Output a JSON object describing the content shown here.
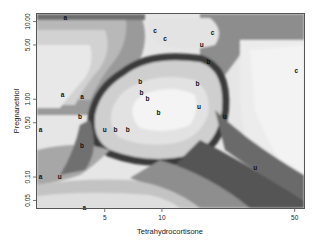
{
  "chart_data": {
    "type": "heatmap",
    "title": "",
    "xlabel": "Tetrahydrocortisone",
    "ylabel": "Pregnanetriol",
    "xscale": "log",
    "yscale": "log",
    "xlim": [
      2.2,
      56
    ],
    "ylim": [
      0.04,
      12.5
    ],
    "xticks": [
      {
        "value": 5,
        "label": "5"
      },
      {
        "value": 10,
        "label": "10"
      },
      {
        "value": 50,
        "label": "50"
      }
    ],
    "yticks": [
      {
        "value": 0.05,
        "label": "0.05"
      },
      {
        "value": 0.1,
        "label": "0.10"
      },
      {
        "value": 0.5,
        "label": "0.50"
      },
      {
        "value": 1.0,
        "label": "1.00"
      },
      {
        "value": 5.0,
        "label": "5.00"
      },
      {
        "value": 10.0,
        "label": "10.00"
      }
    ],
    "grid": false,
    "legend": "none",
    "colormap": "greyscale (dark = class boundary, light = class interior)",
    "points": [
      {
        "label": "a",
        "x": 3.1,
        "y": 11.1
      },
      {
        "label": "a",
        "x": 3.0,
        "y": 1.15
      },
      {
        "label": "a",
        "x": 3.8,
        "y": 1.07
      },
      {
        "label": "a",
        "x": 2.3,
        "y": 0.4
      },
      {
        "label": "a",
        "x": 2.3,
        "y": 0.1
      },
      {
        "label": "a",
        "x": 3.9,
        "y": 0.04
      },
      {
        "label": "b",
        "x": 3.7,
        "y": 0.6
      },
      {
        "label": "b",
        "x": 3.8,
        "y": 0.25
      },
      {
        "label": "b",
        "x": 7.7,
        "y": 1.7
      },
      {
        "label": "b",
        "x": 7.8,
        "y": 1.2
      },
      {
        "label": "b",
        "x": 8.4,
        "y": 1.0
      },
      {
        "label": "b",
        "x": 9.6,
        "y": 0.68
      },
      {
        "label": "b",
        "x": 15.4,
        "y": 1.6
      },
      {
        "label": "b",
        "x": 5.7,
        "y": 0.4
      },
      {
        "label": "b",
        "x": 6.6,
        "y": 0.4
      },
      {
        "label": "b",
        "x": 17.6,
        "y": 3.0
      },
      {
        "label": "c",
        "x": 9.2,
        "y": 7.5
      },
      {
        "label": "c",
        "x": 10.4,
        "y": 6.0
      },
      {
        "label": "c",
        "x": 18.5,
        "y": 7.2
      },
      {
        "label": "c",
        "x": 51.0,
        "y": 2.3
      },
      {
        "label": "u",
        "x": 16.2,
        "y": 5.0
      },
      {
        "label": "u",
        "x": 5.0,
        "y": 0.4
      },
      {
        "label": "u",
        "x": 15.7,
        "y": 0.8
      },
      {
        "label": "u",
        "x": 21.4,
        "y": 0.6
      },
      {
        "label": "u",
        "x": 2.9,
        "y": 0.1
      },
      {
        "label": "u",
        "x": 31.0,
        "y": 0.13
      }
    ]
  }
}
